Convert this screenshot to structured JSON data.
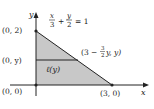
{
  "diagram": {
    "type": "region-triangle",
    "axes": {
      "x_label": "x",
      "y_label": "y"
    },
    "points": {
      "origin": "(0, 0)",
      "y_intercept": "(0, 2)",
      "x_intercept": "(3, 0)",
      "left_point": "(0, y)",
      "right_point": {
        "prefix": "(3 − ",
        "frac_num": "3",
        "frac_den": "2",
        "suffix": "y, y)"
      }
    },
    "line_equation": {
      "term1_num": "x",
      "term1_den": "3",
      "plus": "+",
      "term2_num": "y",
      "term2_den": "2",
      "rhs": "= 1"
    },
    "segment_label": "ℓ(y)",
    "colors": {
      "fill": "#c8c8c8",
      "stroke": "#222222",
      "background": "#ffffff"
    }
  }
}
